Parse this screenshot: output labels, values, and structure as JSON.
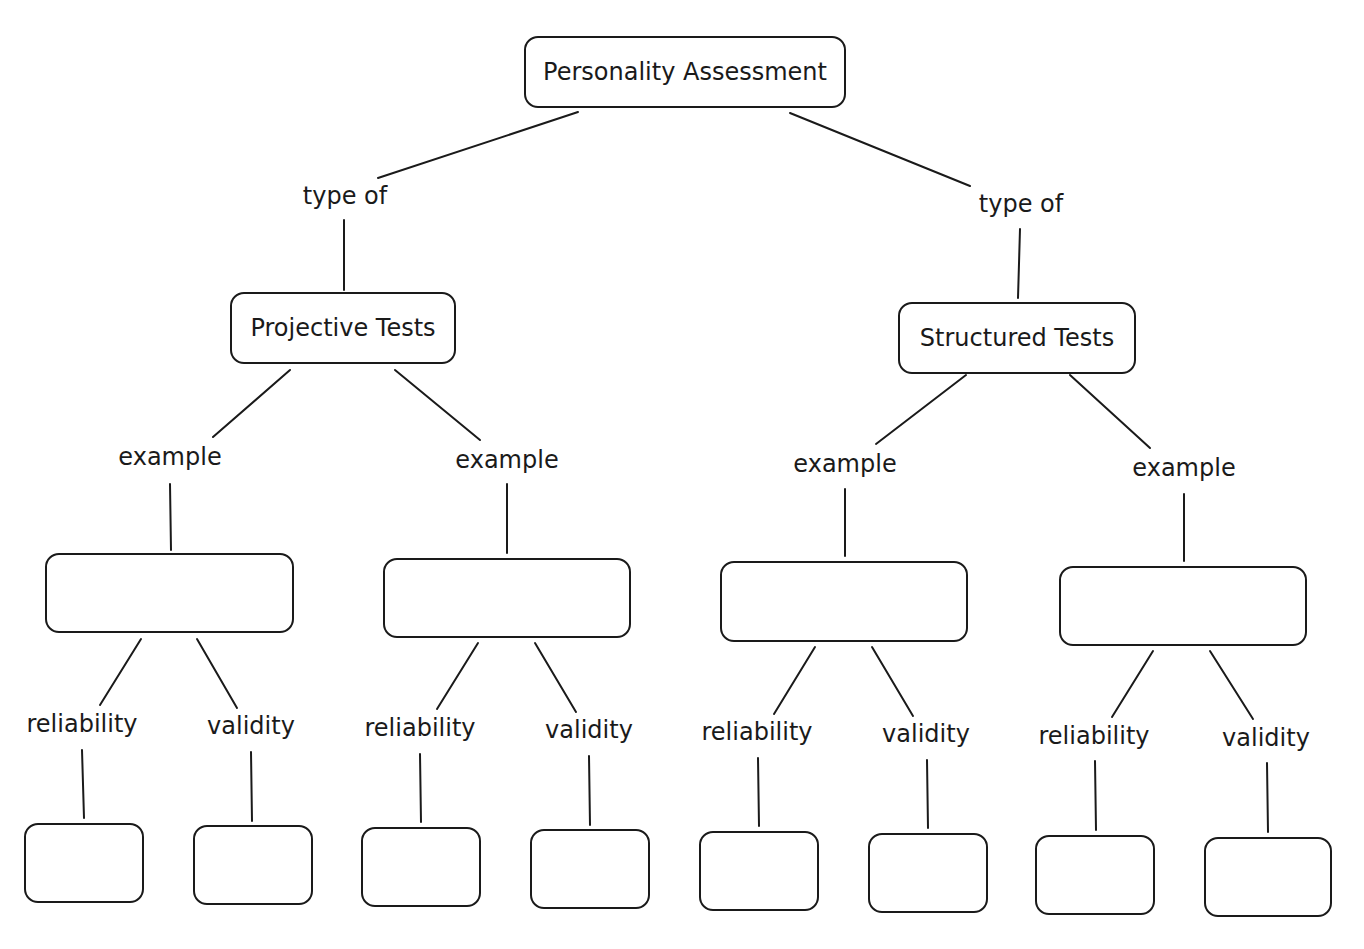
{
  "diagram": {
    "title": "Personality Assessment",
    "root": {
      "label": "Personality Assessment"
    },
    "branches": [
      {
        "link_label": "type of",
        "node": {
          "label": "Projective Tests"
        },
        "examples": [
          {
            "link_label": "example",
            "node": {
              "label": ""
            },
            "properties": [
              {
                "link_label": "reliability",
                "node": {
                  "label": ""
                }
              },
              {
                "link_label": "validity",
                "node": {
                  "label": ""
                }
              }
            ]
          },
          {
            "link_label": "example",
            "node": {
              "label": ""
            },
            "properties": [
              {
                "link_label": "reliability",
                "node": {
                  "label": ""
                }
              },
              {
                "link_label": "validity",
                "node": {
                  "label": ""
                }
              }
            ]
          }
        ]
      },
      {
        "link_label": "type of",
        "node": {
          "label": "Structured Tests"
        },
        "examples": [
          {
            "link_label": "example",
            "node": {
              "label": ""
            },
            "properties": [
              {
                "link_label": "reliability",
                "node": {
                  "label": ""
                }
              },
              {
                "link_label": "validity",
                "node": {
                  "label": ""
                }
              }
            ]
          },
          {
            "link_label": "example",
            "node": {
              "label": ""
            },
            "properties": [
              {
                "link_label": "reliability",
                "node": {
                  "label": ""
                }
              },
              {
                "link_label": "validity",
                "node": {
                  "label": ""
                }
              }
            ]
          }
        ]
      }
    ]
  },
  "colors": {
    "stroke": "#1a1a1a",
    "background": "#ffffff",
    "text": "#1a1a1a"
  }
}
